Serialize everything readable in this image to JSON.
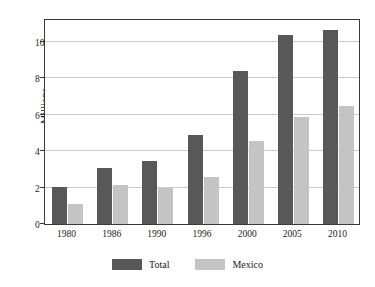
{
  "chart_data": {
    "type": "bar",
    "title": "",
    "subtitle": "",
    "xlabel": "",
    "ylabel": "Millions",
    "categories": [
      "1980",
      "1986",
      "1990",
      "1996",
      "2000",
      "2005",
      "2010"
    ],
    "series": [
      {
        "name": "Total",
        "color": "#585858",
        "values": [
          2.05,
          3.1,
          3.45,
          4.9,
          8.4,
          10.35,
          10.65
        ]
      },
      {
        "name": "Mexico",
        "color": "#c4c4c4",
        "values": [
          1.1,
          2.15,
          1.95,
          2.6,
          4.55,
          5.85,
          6.5
        ]
      }
    ],
    "ylim": [
      0,
      11.3
    ],
    "yticks": [
      0,
      2,
      4,
      6,
      8,
      10
    ],
    "ytick_labels": [
      "0",
      "2",
      "4",
      "6",
      "8",
      "10"
    ],
    "grid": true,
    "grid_axis": "y",
    "legend_position": "bottom",
    "legend_entries": [
      "Total",
      "Mexico"
    ],
    "annotations": []
  },
  "axes": {
    "y_title": "Millions",
    "frame_color": "#3a3a3a",
    "grid_color": "#c9c9c9",
    "background": "#ffffff"
  }
}
